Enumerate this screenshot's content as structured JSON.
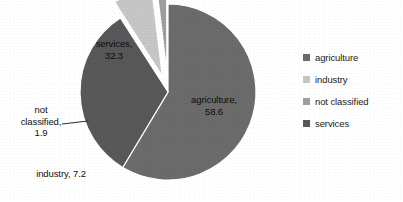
{
  "chart_data": {
    "type": "pie",
    "title": "",
    "subtitle": "",
    "labels": [
      "agriculture",
      "industry",
      "not classified",
      "services"
    ],
    "values": [
      58.6,
      32.3,
      7.2,
      1.9
    ],
    "slices": [
      {
        "name": "agriculture",
        "value": 58.6,
        "label_text": "agriculture,\n58.6",
        "color": "#6b6b6b",
        "start_angle": 0,
        "sweep": 210.96,
        "exploded": false,
        "explode_offset": 5,
        "label_position": "inside"
      },
      {
        "name": "services",
        "value": 32.3,
        "label_text": "services,\n32.3",
        "color": "#585858",
        "start_angle": 210.96,
        "sweep": 116.28,
        "exploded": false,
        "explode_offset": 5,
        "label_position": "inside"
      },
      {
        "name": "industry",
        "value": 7.2,
        "label_text": "industry, 7.2",
        "color": "#c6c6c6",
        "start_angle": 327.24,
        "sweep": 25.92,
        "exploded": true,
        "explode_offset": 17,
        "label_position": "outside"
      },
      {
        "name": "not classified",
        "value": 1.9,
        "label_text": "not\nclassified,\n1.9",
        "color": "#9e9e9e",
        "start_angle": 353.16,
        "sweep": 6.84,
        "exploded": true,
        "explode_offset": 21,
        "label_position": "outside"
      }
    ],
    "legend": {
      "position": "right",
      "entries": [
        {
          "label": "agriculture",
          "color": "#6b6b6b"
        },
        {
          "label": "industry",
          "color": "#c6c6c6"
        },
        {
          "label": "not classified",
          "color": "#9e9e9e"
        },
        {
          "label": "services",
          "color": "#585858"
        }
      ]
    },
    "total": 100.0,
    "units": "percent",
    "background_color": "#ffffff",
    "geometry": {
      "center_x": 168,
      "center_y": 92,
      "radius": 88,
      "rotation_deg": -90
    },
    "leader_lines": [
      {
        "for": "not classified",
        "x1": 62,
        "y1": 124,
        "x2": 88,
        "y2": 121
      }
    ]
  },
  "labels": {
    "agriculture": "agriculture,\n58.6",
    "services": "services,\n32.3",
    "industry": "industry, 7.2",
    "not_classified": "not\nclassified,\n1.9"
  },
  "footnote": {
    "cut_off_text": ""
  }
}
